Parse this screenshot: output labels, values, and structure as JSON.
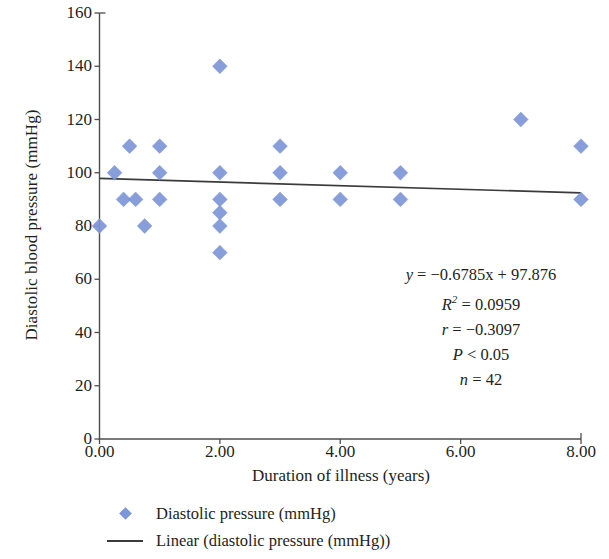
{
  "chart_data": {
    "type": "scatter",
    "title": "",
    "xlabel": "Duration of illness (years)",
    "ylabel": "Diastolic blood pressure (mmHg)",
    "xlim": [
      0,
      8
    ],
    "ylim": [
      0,
      160
    ],
    "xticks": [
      "0.00",
      "2.00",
      "4.00",
      "6.00",
      "8.00"
    ],
    "xtick_values": [
      0,
      2,
      4,
      6,
      8
    ],
    "yticks": [
      "0",
      "20",
      "40",
      "60",
      "80",
      "100",
      "120",
      "140",
      "160"
    ],
    "ytick_values": [
      0,
      20,
      40,
      60,
      80,
      100,
      120,
      140,
      160
    ],
    "grid": false,
    "legend_position": "bottom",
    "marker_color": "#7d96d8",
    "trendline_color": "#3b3b3b",
    "axis_color": "#4d4d4d",
    "series": [
      {
        "name": "Diastolic pressure (mmHg)",
        "type": "scatter",
        "points": [
          [
            0.0,
            80
          ],
          [
            0.25,
            100
          ],
          [
            0.4,
            90
          ],
          [
            0.5,
            110
          ],
          [
            0.6,
            90
          ],
          [
            0.75,
            80
          ],
          [
            1.0,
            110
          ],
          [
            1.0,
            100
          ],
          [
            1.0,
            90
          ],
          [
            2.0,
            140
          ],
          [
            2.0,
            100
          ],
          [
            2.0,
            90
          ],
          [
            2.0,
            85
          ],
          [
            2.0,
            80
          ],
          [
            2.0,
            70
          ],
          [
            3.0,
            110
          ],
          [
            3.0,
            100
          ],
          [
            3.0,
            90
          ],
          [
            4.0,
            100
          ],
          [
            4.0,
            90
          ],
          [
            5.0,
            100
          ],
          [
            5.0,
            90
          ],
          [
            7.0,
            120
          ],
          [
            8.0,
            110
          ],
          [
            8.0,
            90
          ]
        ]
      },
      {
        "name": "Linear (diastolic pressure (mmHg))",
        "type": "line",
        "equation": "y = -0.6785x + 97.876",
        "slope": -0.6785,
        "intercept": 97.876,
        "x_start": 0,
        "x_end": 8,
        "y_start": 97.876,
        "y_end": 92.448
      }
    ],
    "annotations": {
      "equation": "y = −0.6785x + 97.876",
      "equation_lhs": "y",
      "equation_rhs": "= −0.6785x + 97.876",
      "r_squared_label": "R",
      "r_squared_exp": "2",
      "r_squared_value": "= 0.0959",
      "r_label": "r",
      "r_value": "= −0.3097",
      "p_label": "P",
      "p_value": "< 0.05",
      "n_label": "n",
      "n_value": "= 42"
    }
  },
  "legend": {
    "items": [
      {
        "key": "marker",
        "label": "Diastolic pressure (mmHg)"
      },
      {
        "key": "line",
        "label": "Linear (diastolic pressure (mmHg))"
      }
    ]
  }
}
